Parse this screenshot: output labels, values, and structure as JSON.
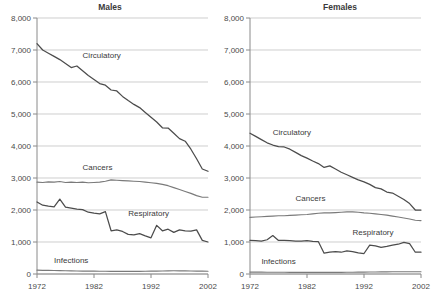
{
  "figure": {
    "width": 440,
    "height": 300,
    "background": "#ffffff"
  },
  "chart_data": [
    {
      "type": "line",
      "title": "Males",
      "xlabel": "",
      "ylabel": "",
      "xlim": [
        1972,
        2002
      ],
      "ylim": [
        0,
        8000
      ],
      "grid": true,
      "legend_position": "inline-annotations",
      "xticks": [
        1972,
        1982,
        1992,
        2002
      ],
      "xtick_labels": [
        "1972",
        "1982",
        "1992",
        "2002"
      ],
      "yticks": [
        0,
        1000,
        2000,
        3000,
        4000,
        5000,
        6000,
        7000,
        8000
      ],
      "ytick_labels": [
        "0",
        "1,000",
        "2,000",
        "3,000",
        "4,000",
        "5,000",
        "6,000",
        "7,000",
        "8,000"
      ],
      "x": [
        1972,
        1973,
        1974,
        1975,
        1976,
        1977,
        1978,
        1979,
        1980,
        1981,
        1982,
        1983,
        1984,
        1985,
        1986,
        1987,
        1988,
        1989,
        1990,
        1991,
        1992,
        1993,
        1994,
        1995,
        1996,
        1997,
        1998,
        1999,
        2000,
        2001,
        2002
      ],
      "series": [
        {
          "name": "Circulatory",
          "color": "#4c4c4c",
          "label_x": 1980,
          "label_y": 6750,
          "values": [
            7200,
            7000,
            6900,
            6800,
            6700,
            6580,
            6450,
            6500,
            6350,
            6200,
            6080,
            5950,
            5900,
            5750,
            5720,
            5550,
            5420,
            5300,
            5200,
            5050,
            4900,
            4750,
            4570,
            4560,
            4400,
            4230,
            4150,
            3900,
            3600,
            3280,
            3210
          ]
        },
        {
          "name": "Cancers",
          "color": "#7a7a7a",
          "label_x": 1980,
          "label_y": 3250,
          "values": [
            2870,
            2860,
            2880,
            2870,
            2890,
            2860,
            2870,
            2860,
            2870,
            2850,
            2860,
            2870,
            2900,
            2940,
            2930,
            2920,
            2910,
            2900,
            2890,
            2870,
            2850,
            2830,
            2800,
            2760,
            2700,
            2640,
            2580,
            2520,
            2450,
            2400,
            2400
          ]
        },
        {
          "name": "Respiratory",
          "color": "#4c4c4c",
          "label_x": 1988,
          "label_y": 1820,
          "values": [
            2250,
            2150,
            2120,
            2100,
            2340,
            2090,
            2060,
            2030,
            2010,
            1930,
            1900,
            1880,
            1950,
            1350,
            1380,
            1330,
            1240,
            1220,
            1260,
            1190,
            1130,
            1520,
            1350,
            1400,
            1300,
            1380,
            1350,
            1340,
            1380,
            1050,
            1000
          ]
        },
        {
          "name": "Infections",
          "color": "#7a7a7a",
          "label_x": 1975,
          "label_y": 330,
          "values": [
            120,
            115,
            112,
            110,
            105,
            100,
            98,
            95,
            92,
            90,
            88,
            86,
            85,
            84,
            83,
            82,
            82,
            82,
            84,
            86,
            88,
            90,
            95,
            98,
            100,
            100,
            98,
            95,
            92,
            88,
            85
          ]
        }
      ]
    },
    {
      "type": "line",
      "title": "Females",
      "xlabel": "",
      "ylabel": "",
      "xlim": [
        1972,
        2002
      ],
      "ylim": [
        0,
        8000
      ],
      "grid": true,
      "legend_position": "inline-annotations",
      "xticks": [
        1972,
        1982,
        1992,
        2002
      ],
      "xtick_labels": [
        "1972",
        "1982",
        "1992",
        "2002"
      ],
      "yticks": [
        0,
        1000,
        2000,
        3000,
        4000,
        5000,
        6000,
        7000,
        8000
      ],
      "ytick_labels": [
        "0",
        "1,000",
        "2,000",
        "3,000",
        "4,000",
        "5,000",
        "6,000",
        "7,000",
        "8,000"
      ],
      "x": [
        1972,
        1973,
        1974,
        1975,
        1976,
        1977,
        1978,
        1979,
        1980,
        1981,
        1982,
        1983,
        1984,
        1985,
        1986,
        1987,
        1988,
        1989,
        1990,
        1991,
        1992,
        1993,
        1994,
        1995,
        1996,
        1997,
        1998,
        1999,
        2000,
        2001,
        2002
      ],
      "series": [
        {
          "name": "Circulatory",
          "color": "#4c4c4c",
          "label_x": 1976,
          "label_y": 4330,
          "values": [
            4400,
            4300,
            4200,
            4100,
            4030,
            3980,
            3970,
            3900,
            3800,
            3700,
            3620,
            3530,
            3450,
            3330,
            3380,
            3280,
            3180,
            3100,
            3020,
            2940,
            2880,
            2800,
            2700,
            2660,
            2560,
            2530,
            2430,
            2330,
            2200,
            2000,
            2000
          ]
        },
        {
          "name": "Cancers",
          "color": "#7a7a7a",
          "label_x": 1980,
          "label_y": 2270,
          "values": [
            1770,
            1780,
            1790,
            1800,
            1810,
            1820,
            1820,
            1830,
            1840,
            1850,
            1860,
            1880,
            1900,
            1910,
            1910,
            1920,
            1930,
            1940,
            1940,
            1930,
            1910,
            1900,
            1880,
            1860,
            1840,
            1810,
            1780,
            1750,
            1720,
            1680,
            1670
          ]
        },
        {
          "name": "Respiratory",
          "color": "#4c4c4c",
          "label_x": 1990,
          "label_y": 1230,
          "values": [
            1050,
            1040,
            1030,
            1070,
            1200,
            1050,
            1050,
            1040,
            1030,
            1030,
            1040,
            1020,
            1010,
            650,
            680,
            700,
            680,
            720,
            700,
            660,
            640,
            900,
            880,
            830,
            860,
            900,
            930,
            990,
            950,
            680,
            680
          ]
        },
        {
          "name": "Infections",
          "color": "#7a7a7a",
          "label_x": 1974,
          "label_y": 310,
          "values": [
            60,
            58,
            57,
            56,
            55,
            54,
            53,
            52,
            52,
            51,
            51,
            50,
            50,
            50,
            50,
            51,
            52,
            54,
            56,
            58,
            60,
            62,
            64,
            66,
            68,
            70,
            70,
            70,
            70,
            70,
            70
          ]
        }
      ]
    }
  ],
  "panels": {
    "males": {
      "title": "Males",
      "annotations": [
        "Circulatory",
        "Cancers",
        "Respiratory",
        "Infections"
      ]
    },
    "females": {
      "title": "Females",
      "annotations": [
        "Circulatory",
        "Cancers",
        "Respiratory",
        "Infections"
      ]
    }
  }
}
